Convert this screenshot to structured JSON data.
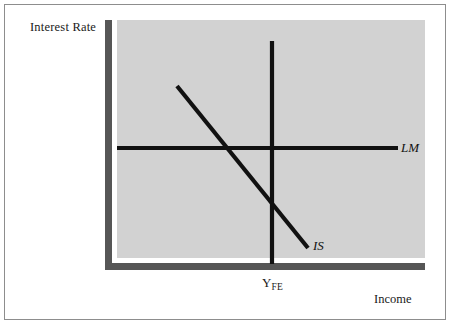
{
  "figure": {
    "type": "economics-diagram",
    "model": "IS-LM",
    "axis_titles": {
      "y": "Interest Rate",
      "x": "Income"
    },
    "tick_labels": {
      "full_employment": {
        "base": "Y",
        "subscript": "FE"
      }
    },
    "curve_labels": {
      "lm": "LM",
      "is": "IS"
    },
    "colors": {
      "plot_background": "#d2d2d2",
      "axis": "#565656",
      "curve": "#111111",
      "page_background": "#ffffff",
      "frame_border": "#8d8d8d",
      "text": "#1a1a1a"
    }
  },
  "chart_data": {
    "type": "line",
    "title": "",
    "subtitle": "",
    "xlabel": "Income",
    "ylabel": "Interest Rate",
    "xlim": [
      117,
      425
    ],
    "ylim": [
      258,
      20
    ],
    "grid": false,
    "legend": "inline-curve-labels",
    "annotations": [
      {
        "text": "LM",
        "x": 401,
        "y": 148,
        "style": "italic"
      },
      {
        "text": "IS",
        "x": 313,
        "y": 246,
        "style": "italic"
      },
      {
        "text": "Y_FE",
        "x": 272,
        "y": 281,
        "style": "subscript"
      }
    ],
    "series": [
      {
        "name": "LM",
        "description": "Horizontal liquidity-preference/money-supply schedule (perfectly elastic)",
        "slope": "horizontal",
        "points": [
          {
            "x": 117,
            "y": 148
          },
          {
            "x": 398,
            "y": 148
          }
        ]
      },
      {
        "name": "IS",
        "description": "Downward-sloping goods-market equilibrium schedule",
        "slope": "negative",
        "points": [
          {
            "x": 177,
            "y": 86
          },
          {
            "x": 308,
            "y": 248
          }
        ]
      },
      {
        "name": "Y_FE",
        "description": "Vertical full-employment output line",
        "slope": "vertical",
        "points": [
          {
            "x": 272,
            "y": 41
          },
          {
            "x": 272,
            "y": 264
          }
        ]
      }
    ],
    "intersections": [
      {
        "label": "IS-LM equilibrium",
        "x": 227,
        "y": 148
      },
      {
        "label": "LM crosses full-employment output",
        "x": 272,
        "y": 148
      },
      {
        "label": "IS crosses full-employment output",
        "x": 272,
        "y": 204
      }
    ]
  }
}
